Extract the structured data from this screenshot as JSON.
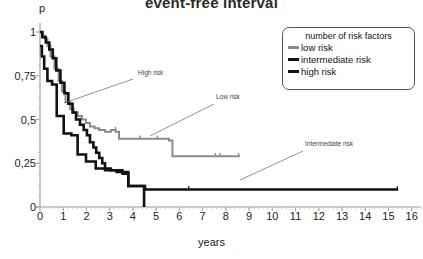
{
  "title": "event-free interval",
  "axes": {
    "ylabel": "p",
    "xlabel": "years",
    "yticks": [
      "1",
      "0,75",
      "0,5",
      "0,25",
      "0"
    ],
    "ytick_values": [
      1,
      0.75,
      0.5,
      0.25,
      0
    ],
    "xticks": [
      "0",
      "1",
      "2",
      "3",
      "4",
      "5",
      "6",
      "7",
      "8",
      "9",
      "10",
      "11",
      "12",
      "13",
      "14",
      "15",
      "16"
    ],
    "xtick_values": [
      0,
      1,
      2,
      3,
      4,
      5,
      6,
      7,
      8,
      9,
      10,
      11,
      12,
      13,
      14,
      15,
      16
    ]
  },
  "legend": {
    "title": "number of risk factors",
    "items": [
      {
        "label": "low risk",
        "color": "#8a8a8a",
        "width": 2.2
      },
      {
        "label": "intermediate risk",
        "color": "#111111",
        "width": 3.0
      },
      {
        "label": "high risk",
        "color": "#111111",
        "width": 3.0
      }
    ]
  },
  "annotations": [
    {
      "name": "high-risk",
      "text": "High risk",
      "tx": 138,
      "ty": 74,
      "x1": 133,
      "y1": 79,
      "x2": 64,
      "y2": 103
    },
    {
      "name": "low-risk",
      "text": "Low risk",
      "tx": 216,
      "ty": 98,
      "x1": 214,
      "y1": 104,
      "x2": 150,
      "y2": 136
    },
    {
      "name": "intermediate-risk",
      "text": "Intermediate risk",
      "tx": 305,
      "ty": 145,
      "x1": 303,
      "y1": 151,
      "x2": 240,
      "y2": 180
    }
  ],
  "chart_data": {
    "type": "line",
    "title": "event-free interval",
    "xlabel": "years",
    "ylabel": "p",
    "xlim": [
      0,
      16.4
    ],
    "ylim": [
      0,
      1.04
    ],
    "grid": false,
    "legend_position": "top-right",
    "series": [
      {
        "name": "low risk",
        "color": "#8a8a8a",
        "x": [
          0.0,
          0.12,
          0.12,
          0.22,
          0.22,
          0.32,
          0.32,
          0.45,
          0.45,
          0.62,
          0.62,
          0.8,
          0.8,
          0.95,
          0.95,
          1.1,
          1.1,
          1.3,
          1.3,
          1.45,
          1.45,
          1.62,
          1.62,
          1.8,
          1.8,
          1.98,
          1.98,
          2.15,
          2.15,
          2.35,
          2.35,
          2.55,
          2.55,
          2.8,
          2.8,
          3.05,
          3.05,
          3.25,
          3.25,
          3.4,
          3.4,
          5.55,
          5.55,
          5.7,
          5.7,
          8.6
        ],
        "y": [
          1.0,
          1.0,
          0.98,
          0.98,
          0.96,
          0.96,
          0.92,
          0.92,
          0.86,
          0.86,
          0.79,
          0.79,
          0.72,
          0.72,
          0.66,
          0.66,
          0.6,
          0.6,
          0.56,
          0.56,
          0.54,
          0.54,
          0.52,
          0.52,
          0.5,
          0.5,
          0.48,
          0.48,
          0.46,
          0.46,
          0.45,
          0.45,
          0.44,
          0.44,
          0.43,
          0.43,
          0.44,
          0.44,
          0.43,
          0.43,
          0.39,
          0.39,
          0.38,
          0.38,
          0.29,
          0.29
        ],
        "censor_marks": [
          [
            3.25,
            0.44
          ],
          [
            4.3,
            0.39
          ],
          [
            5.05,
            0.39
          ],
          [
            7.55,
            0.29
          ],
          [
            7.75,
            0.29
          ],
          [
            8.55,
            0.29
          ]
        ]
      },
      {
        "name": "intermediate risk",
        "color": "#111111",
        "x": [
          0.0,
          0.1,
          0.1,
          0.25,
          0.25,
          0.4,
          0.4,
          0.55,
          0.55,
          0.7,
          0.7,
          0.88,
          0.88,
          1.05,
          1.05,
          1.22,
          1.22,
          1.4,
          1.4,
          1.55,
          1.55,
          1.72,
          1.72,
          1.88,
          1.88,
          2.02,
          2.02,
          2.15,
          2.15,
          2.3,
          2.3,
          2.42,
          2.42,
          2.55,
          2.55,
          2.68,
          2.68,
          2.8,
          2.8,
          3.05,
          3.05,
          3.55,
          3.55,
          3.8,
          3.8,
          4.52,
          4.52,
          15.42
        ],
        "y": [
          1.0,
          1.0,
          0.97,
          0.97,
          0.94,
          0.94,
          0.9,
          0.9,
          0.85,
          0.85,
          0.78,
          0.78,
          0.71,
          0.71,
          0.65,
          0.65,
          0.59,
          0.59,
          0.54,
          0.54,
          0.5,
          0.5,
          0.47,
          0.47,
          0.44,
          0.44,
          0.41,
          0.41,
          0.37,
          0.37,
          0.34,
          0.34,
          0.31,
          0.31,
          0.28,
          0.28,
          0.25,
          0.25,
          0.22,
          0.22,
          0.21,
          0.21,
          0.19,
          0.19,
          0.12,
          0.12,
          0.1,
          0.1
        ],
        "censor_marks": [
          [
            6.4,
            0.1
          ],
          [
            15.38,
            0.1
          ]
        ]
      },
      {
        "name": "high risk",
        "color": "#111111",
        "x": [
          0.0,
          0.08,
          0.08,
          0.18,
          0.18,
          0.32,
          0.32,
          0.52,
          0.52,
          0.72,
          0.72,
          1.02,
          1.02,
          1.35,
          1.35,
          1.62,
          1.62,
          1.98,
          1.98,
          2.4,
          2.4,
          2.8,
          2.8,
          3.3,
          3.3,
          3.8,
          3.8,
          4.48,
          4.48
        ],
        "y": [
          0.92,
          0.92,
          0.86,
          0.86,
          0.79,
          0.79,
          0.72,
          0.72,
          0.7,
          0.7,
          0.52,
          0.52,
          0.42,
          0.42,
          0.41,
          0.41,
          0.3,
          0.3,
          0.26,
          0.26,
          0.22,
          0.22,
          0.21,
          0.21,
          0.2,
          0.2,
          0.12,
          0.12,
          0.0
        ],
        "censor_marks": []
      }
    ]
  },
  "plot_geometry": {
    "left": 40,
    "right": 421,
    "top": 25,
    "bottom": 207,
    "x_min": 0,
    "x_max": 16.4,
    "y_min": 0,
    "y_max": 1.04
  }
}
